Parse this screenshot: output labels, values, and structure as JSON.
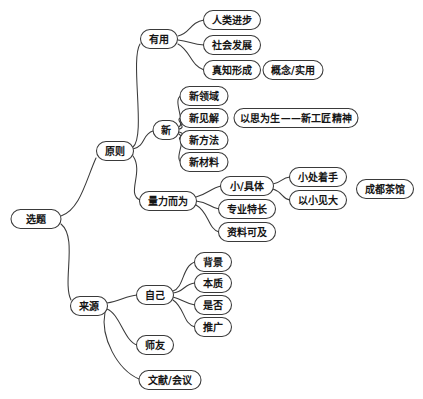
{
  "diagram": {
    "type": "mind-map",
    "title": "选题",
    "background_color": "#ffffff",
    "stroke_color": "#3a3a3a",
    "text_color": "#151515",
    "nodes": [
      {
        "id": "root",
        "label": "选题",
        "cx": 36,
        "cy": 219,
        "w": 50,
        "h": 19,
        "fs": 10
      },
      {
        "id": "principle",
        "label": "原则",
        "cx": 115,
        "cy": 151,
        "w": 37,
        "h": 19,
        "fs": 10
      },
      {
        "id": "source",
        "label": "来源",
        "cx": 89,
        "cy": 306,
        "w": 37,
        "h": 19,
        "fs": 10
      },
      {
        "id": "useful",
        "label": "有用",
        "cx": 159,
        "cy": 39,
        "w": 37,
        "h": 19,
        "fs": 10
      },
      {
        "id": "new",
        "label": "新",
        "cx": 166,
        "cy": 130,
        "w": 26,
        "h": 19,
        "fs": 10
      },
      {
        "id": "capacity",
        "label": "量力而为",
        "cx": 168,
        "cy": 201,
        "w": 57,
        "h": 19,
        "fs": 10
      },
      {
        "id": "progress",
        "label": "人类进步",
        "cx": 232,
        "cy": 20,
        "w": 57,
        "h": 19,
        "fs": 10
      },
      {
        "id": "society",
        "label": "社会发展",
        "cx": 232,
        "cy": 45,
        "w": 57,
        "h": 19,
        "fs": 10
      },
      {
        "id": "truth",
        "label": "真知形成",
        "cx": 232,
        "cy": 70,
        "w": 57,
        "h": 19,
        "fs": 10
      },
      {
        "id": "concept",
        "label": "概念/实用",
        "cx": 293,
        "cy": 70,
        "w": 60,
        "h": 19,
        "fs": 10
      },
      {
        "id": "newfield",
        "label": "新领域",
        "cx": 204,
        "cy": 96,
        "w": 48,
        "h": 19,
        "fs": 10
      },
      {
        "id": "newview",
        "label": "新见解",
        "cx": 204,
        "cy": 118,
        "w": 48,
        "h": 19,
        "fs": 10
      },
      {
        "id": "newmethod",
        "label": "新方法",
        "cx": 204,
        "cy": 140,
        "w": 48,
        "h": 19,
        "fs": 10
      },
      {
        "id": "newmaterial",
        "label": "新材料",
        "cx": 204,
        "cy": 162,
        "w": 48,
        "h": 19,
        "fs": 10
      },
      {
        "id": "spirit",
        "label": "以思为生——新工匠精神",
        "cx": 296,
        "cy": 118,
        "w": 124,
        "h": 19,
        "fs": 10
      },
      {
        "id": "concrete",
        "label": "小/具体",
        "cx": 247,
        "cy": 186,
        "w": 53,
        "h": 19,
        "fs": 10
      },
      {
        "id": "specialty",
        "label": "专业特长",
        "cx": 247,
        "cy": 209,
        "w": 57,
        "h": 19,
        "fs": 10
      },
      {
        "id": "materials",
        "label": "资料可及",
        "cx": 247,
        "cy": 232,
        "w": 57,
        "h": 19,
        "fs": 10
      },
      {
        "id": "startsmall",
        "label": "小处着手",
        "cx": 318,
        "cy": 177,
        "w": 57,
        "h": 19,
        "fs": 10
      },
      {
        "id": "seebig",
        "label": "以小见大",
        "cx": 318,
        "cy": 200,
        "w": 57,
        "h": 19,
        "fs": 10
      },
      {
        "id": "teahouse",
        "label": "成都茶馆",
        "cx": 385,
        "cy": 189,
        "w": 57,
        "h": 19,
        "fs": 10
      },
      {
        "id": "self",
        "label": "自己",
        "cx": 155,
        "cy": 295,
        "w": 37,
        "h": 19,
        "fs": 10
      },
      {
        "id": "mentor",
        "label": "师友",
        "cx": 155,
        "cy": 345,
        "w": 37,
        "h": 19,
        "fs": 10
      },
      {
        "id": "literature",
        "label": "文献/会议",
        "cx": 170,
        "cy": 380,
        "w": 62,
        "h": 19,
        "fs": 10
      },
      {
        "id": "background",
        "label": "背景",
        "cx": 213,
        "cy": 262,
        "w": 37,
        "h": 19,
        "fs": 10
      },
      {
        "id": "essence",
        "label": "本质",
        "cx": 213,
        "cy": 283,
        "w": 37,
        "h": 19,
        "fs": 10
      },
      {
        "id": "whether",
        "label": "是否",
        "cx": 213,
        "cy": 305,
        "w": 37,
        "h": 19,
        "fs": 10
      },
      {
        "id": "promote",
        "label": "推广",
        "cx": 213,
        "cy": 327,
        "w": 37,
        "h": 19,
        "fs": 10
      }
    ],
    "edges": [
      {
        "from": "root",
        "to": "principle",
        "d": "M 61 216 C 80 210 86 180 96 158"
      },
      {
        "from": "root",
        "to": "source",
        "d": "M 61 224 C 78 238 62 282 71 300"
      },
      {
        "from": "principle",
        "to": "useful",
        "d": "M 133 147 C 146 136 130 60 140 44"
      },
      {
        "from": "principle",
        "to": "new",
        "d": "M 133 149 C 146 146 142 134 153 131"
      },
      {
        "from": "principle",
        "to": "capacity",
        "d": "M 133 156 C 144 172 126 194 140 200"
      },
      {
        "from": "useful",
        "to": "progress",
        "d": "M 178 36 C 190 34 190 22 204 20"
      },
      {
        "from": "useful",
        "to": "society",
        "d": "M 178 40 C 190 41 192 45 204 45"
      },
      {
        "from": "useful",
        "to": "truth",
        "d": "M 178 44 C 190 50 191 66 204 70"
      },
      {
        "from": "new",
        "to": "newfield",
        "d": "M 179 127 C 186 123 172 99 181 96"
      },
      {
        "from": "new",
        "to": "newview",
        "d": "M 179 129 C 188 128 174 119 181 118"
      },
      {
        "from": "new",
        "to": "newmethod",
        "d": "M 179 132 C 188 134 175 138 181 140"
      },
      {
        "from": "new",
        "to": "newmaterial",
        "d": "M 179 134 C 187 140 174 158 181 162"
      },
      {
        "from": "capacity",
        "to": "concrete",
        "d": "M 196 197 C 208 194 211 188 221 186"
      },
      {
        "from": "capacity",
        "to": "specialty",
        "d": "M 196 201 C 209 202 210 208 219 209"
      },
      {
        "from": "capacity",
        "to": "materials",
        "d": "M 196 205 C 209 212 208 229 219 232"
      },
      {
        "from": "concrete",
        "to": "startsmall",
        "d": "M 273 184 C 283 182 281 178 290 177"
      },
      {
        "from": "concrete",
        "to": "seebig",
        "d": "M 273 189 C 283 192 282 199 290 200"
      },
      {
        "from": "source",
        "to": "self",
        "d": "M 107 303 C 120 301 126 296 137 295"
      },
      {
        "from": "source",
        "to": "mentor",
        "d": "M 107 309 C 120 314 124 341 137 345"
      },
      {
        "from": "source",
        "to": "literature",
        "d": "M 105 312 C 100 338 118 370 139 379"
      },
      {
        "from": "self",
        "to": "background",
        "d": "M 173 291 C 184 288 182 266 195 262"
      },
      {
        "from": "self",
        "to": "essence",
        "d": "M 173 293 C 184 292 184 284 195 283"
      },
      {
        "from": "self",
        "to": "whether",
        "d": "M 173 297 C 184 300 184 303 195 305"
      },
      {
        "from": "self",
        "to": "promote",
        "d": "M 173 300 C 185 308 183 324 195 327"
      }
    ]
  }
}
